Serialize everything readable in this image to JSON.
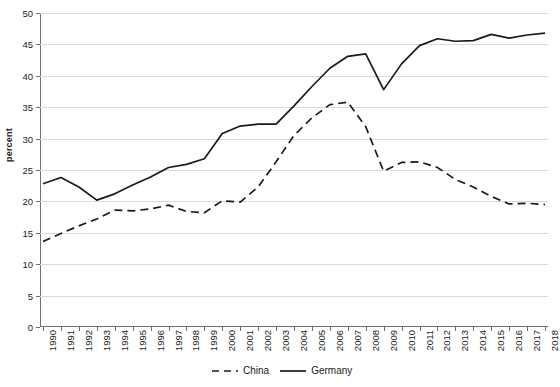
{
  "chart_data": {
    "type": "line",
    "title": "",
    "xlabel": "",
    "ylabel": "percent",
    "ylim": [
      0,
      50
    ],
    "yticks": [
      0,
      5,
      10,
      15,
      20,
      25,
      30,
      35,
      40,
      45,
      50
    ],
    "grid": true,
    "legend_position": "bottom",
    "categories": [
      "1990",
      "1991",
      "1992",
      "1993",
      "1994",
      "1995",
      "1996",
      "1997",
      "1998",
      "1999",
      "2000",
      "2001",
      "2002",
      "2003",
      "2004",
      "2005",
      "2006",
      "2007",
      "2008",
      "2009",
      "2010",
      "2011",
      "2012",
      "2013",
      "2014",
      "2015",
      "2016",
      "2017",
      "2018"
    ],
    "series": [
      {
        "name": "China",
        "style": "dashed",
        "color": "#1a1a1a",
        "values": [
          13.6,
          14.9,
          16.1,
          17.2,
          18.6,
          18.5,
          18.8,
          19.4,
          18.4,
          18.2,
          20.1,
          19.9,
          22.3,
          26.3,
          30.5,
          33.3,
          35.4,
          35.8,
          31.9,
          24.8,
          26.2,
          26.3,
          25.4,
          23.5,
          22.3,
          20.8,
          19.6,
          19.7,
          19.5
        ]
      },
      {
        "name": "Germany",
        "style": "solid",
        "color": "#1a1a1a",
        "values": [
          22.8,
          23.8,
          22.3,
          20.2,
          21.2,
          22.6,
          23.9,
          25.4,
          25.9,
          26.8,
          30.8,
          32.0,
          32.3,
          32.3,
          35.2,
          38.3,
          41.2,
          43.1,
          43.5,
          37.8,
          41.9,
          44.8,
          45.9,
          45.5,
          45.6,
          46.6,
          46.0,
          46.5,
          46.8
        ]
      }
    ]
  },
  "legend": {
    "items": [
      {
        "label": "China",
        "style": "dashed"
      },
      {
        "label": "Germany",
        "style": "solid"
      }
    ]
  }
}
